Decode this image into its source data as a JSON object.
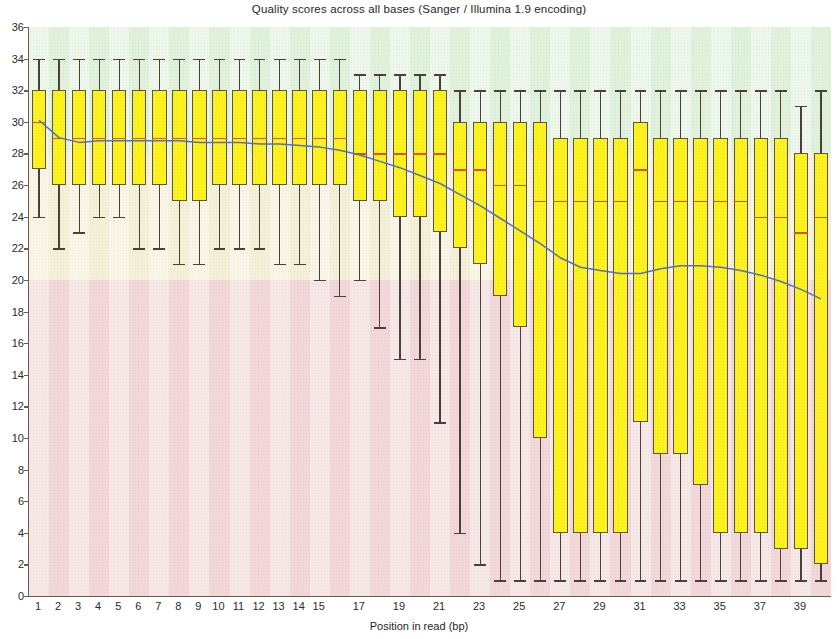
{
  "chart_data": {
    "type": "box",
    "title": "Quality scores across all bases (Sanger / Illumina 1.9 encoding)",
    "xlabel": "Position in read (bp)",
    "ylabel": "",
    "ylim": [
      0,
      36
    ],
    "ytick_step": 2,
    "yticks": [
      0,
      2,
      4,
      6,
      8,
      10,
      12,
      14,
      16,
      18,
      20,
      22,
      24,
      26,
      28,
      30,
      32,
      34,
      36
    ],
    "xlim": [
      0.5,
      40.5
    ],
    "xticks": [
      1,
      2,
      3,
      4,
      5,
      6,
      7,
      8,
      9,
      10,
      11,
      12,
      13,
      14,
      15,
      17,
      19,
      21,
      23,
      25,
      27,
      29,
      31,
      33,
      35,
      37,
      39
    ],
    "grid": false,
    "legend": "none",
    "background_bands": [
      {
        "name": "poor",
        "from": 0,
        "to": 20,
        "color": "#f2d8d8"
      },
      {
        "name": "reasonable",
        "from": 20,
        "to": 28,
        "color": "#f5f0d8"
      },
      {
        "name": "good",
        "from": 28,
        "to": 36,
        "color": "#e0f2dc"
      }
    ],
    "box_color": "#fcf21e",
    "box_edge_color": "#5d5348",
    "median_color": "#d4561d",
    "mean_line_color": "#5b6fb5",
    "positions": [
      1,
      2,
      3,
      4,
      5,
      6,
      7,
      8,
      9,
      10,
      11,
      12,
      13,
      14,
      15,
      16,
      17,
      18,
      19,
      20,
      21,
      22,
      23,
      24,
      25,
      26,
      27,
      28,
      29,
      30,
      31,
      32,
      33,
      34,
      35,
      36,
      37,
      38,
      39,
      40
    ],
    "boxes": [
      {
        "x": 1,
        "whisker_low": 24,
        "q1": 27,
        "median": 30,
        "q3": 32,
        "whisker_high": 34
      },
      {
        "x": 2,
        "whisker_low": 22,
        "q1": 26,
        "median": 29,
        "q3": 32,
        "whisker_high": 34
      },
      {
        "x": 3,
        "whisker_low": 23,
        "q1": 26,
        "median": 29,
        "q3": 32,
        "whisker_high": 34
      },
      {
        "x": 4,
        "whisker_low": 24,
        "q1": 26,
        "median": 29,
        "q3": 32,
        "whisker_high": 34
      },
      {
        "x": 5,
        "whisker_low": 24,
        "q1": 26,
        "median": 29,
        "q3": 32,
        "whisker_high": 34
      },
      {
        "x": 6,
        "whisker_low": 22,
        "q1": 26,
        "median": 29,
        "q3": 32,
        "whisker_high": 34
      },
      {
        "x": 7,
        "whisker_low": 22,
        "q1": 26,
        "median": 29,
        "q3": 32,
        "whisker_high": 34
      },
      {
        "x": 8,
        "whisker_low": 21,
        "q1": 25,
        "median": 29,
        "q3": 32,
        "whisker_high": 34
      },
      {
        "x": 9,
        "whisker_low": 21,
        "q1": 25,
        "median": 29,
        "q3": 32,
        "whisker_high": 34
      },
      {
        "x": 10,
        "whisker_low": 22,
        "q1": 26,
        "median": 29,
        "q3": 32,
        "whisker_high": 34
      },
      {
        "x": 11,
        "whisker_low": 22,
        "q1": 26,
        "median": 29,
        "q3": 32,
        "whisker_high": 34
      },
      {
        "x": 12,
        "whisker_low": 22,
        "q1": 26,
        "median": 29,
        "q3": 32,
        "whisker_high": 34
      },
      {
        "x": 13,
        "whisker_low": 21,
        "q1": 26,
        "median": 29,
        "q3": 32,
        "whisker_high": 34
      },
      {
        "x": 14,
        "whisker_low": 21,
        "q1": 26,
        "median": 29,
        "q3": 32,
        "whisker_high": 34
      },
      {
        "x": 15,
        "whisker_low": 20,
        "q1": 26,
        "median": 29,
        "q3": 32,
        "whisker_high": 34
      },
      {
        "x": 16,
        "whisker_low": 19,
        "q1": 26,
        "median": 29,
        "q3": 32,
        "whisker_high": 34
      },
      {
        "x": 17,
        "whisker_low": 20,
        "q1": 25,
        "median": 28,
        "q3": 32,
        "whisker_high": 33
      },
      {
        "x": 18,
        "whisker_low": 17,
        "q1": 25,
        "median": 28,
        "q3": 32,
        "whisker_high": 33
      },
      {
        "x": 19,
        "whisker_low": 15,
        "q1": 24,
        "median": 28,
        "q3": 32,
        "whisker_high": 33
      },
      {
        "x": 20,
        "whisker_low": 15,
        "q1": 24,
        "median": 28,
        "q3": 32,
        "whisker_high": 33
      },
      {
        "x": 21,
        "whisker_low": 11,
        "q1": 23,
        "median": 28,
        "q3": 32,
        "whisker_high": 33
      },
      {
        "x": 22,
        "whisker_low": 4,
        "q1": 22,
        "median": 27,
        "q3": 30,
        "whisker_high": 32
      },
      {
        "x": 23,
        "whisker_low": 2,
        "q1": 21,
        "median": 27,
        "q3": 30,
        "whisker_high": 32
      },
      {
        "x": 24,
        "whisker_low": 1,
        "q1": 19,
        "median": 26,
        "q3": 30,
        "whisker_high": 32
      },
      {
        "x": 25,
        "whisker_low": 1,
        "q1": 17,
        "median": 26,
        "q3": 30,
        "whisker_high": 32
      },
      {
        "x": 26,
        "whisker_low": 1,
        "q1": 10,
        "median": 25,
        "q3": 30,
        "whisker_high": 32
      },
      {
        "x": 27,
        "whisker_low": 1,
        "q1": 4,
        "median": 25,
        "q3": 29,
        "whisker_high": 32
      },
      {
        "x": 28,
        "whisker_low": 1,
        "q1": 4,
        "median": 25,
        "q3": 29,
        "whisker_high": 32
      },
      {
        "x": 29,
        "whisker_low": 1,
        "q1": 4,
        "median": 25,
        "q3": 29,
        "whisker_high": 32
      },
      {
        "x": 30,
        "whisker_low": 1,
        "q1": 4,
        "median": 25,
        "q3": 29,
        "whisker_high": 32
      },
      {
        "x": 31,
        "whisker_low": 1,
        "q1": 11,
        "median": 27,
        "q3": 30,
        "whisker_high": 32
      },
      {
        "x": 32,
        "whisker_low": 1,
        "q1": 9,
        "median": 25,
        "q3": 29,
        "whisker_high": 32
      },
      {
        "x": 33,
        "whisker_low": 1,
        "q1": 9,
        "median": 25,
        "q3": 29,
        "whisker_high": 32
      },
      {
        "x": 34,
        "whisker_low": 1,
        "q1": 7,
        "median": 25,
        "q3": 29,
        "whisker_high": 32
      },
      {
        "x": 35,
        "whisker_low": 1,
        "q1": 4,
        "median": 25,
        "q3": 29,
        "whisker_high": 32
      },
      {
        "x": 36,
        "whisker_low": 1,
        "q1": 4,
        "median": 25,
        "q3": 29,
        "whisker_high": 32
      },
      {
        "x": 37,
        "whisker_low": 1,
        "q1": 4,
        "median": 24,
        "q3": 29,
        "whisker_high": 32
      },
      {
        "x": 38,
        "whisker_low": 1,
        "q1": 3,
        "median": 24,
        "q3": 29,
        "whisker_high": 32
      },
      {
        "x": 39,
        "whisker_low": 1,
        "q1": 3,
        "median": 23,
        "q3": 28,
        "whisker_high": 31
      },
      {
        "x": 40,
        "whisker_low": 1,
        "q1": 2,
        "median": 24,
        "q3": 28,
        "whisker_high": 32
      }
    ],
    "mean_line": {
      "name": "Mean quality",
      "x": [
        1,
        2,
        3,
        4,
        5,
        6,
        7,
        8,
        9,
        10,
        11,
        12,
        13,
        14,
        15,
        16,
        17,
        18,
        19,
        20,
        21,
        22,
        23,
        24,
        25,
        26,
        27,
        28,
        29,
        30,
        31,
        32,
        33,
        34,
        35,
        36,
        37,
        38,
        39,
        40
      ],
      "y": [
        30.1,
        29.0,
        28.7,
        28.8,
        28.8,
        28.8,
        28.8,
        28.8,
        28.7,
        28.7,
        28.7,
        28.6,
        28.6,
        28.5,
        28.4,
        28.2,
        27.9,
        27.5,
        27.1,
        26.6,
        26.1,
        25.4,
        24.7,
        23.9,
        23.1,
        22.3,
        21.4,
        20.8,
        20.6,
        20.4,
        20.4,
        20.7,
        20.9,
        20.9,
        20.8,
        20.6,
        20.3,
        19.9,
        19.4,
        18.8
      ]
    }
  }
}
